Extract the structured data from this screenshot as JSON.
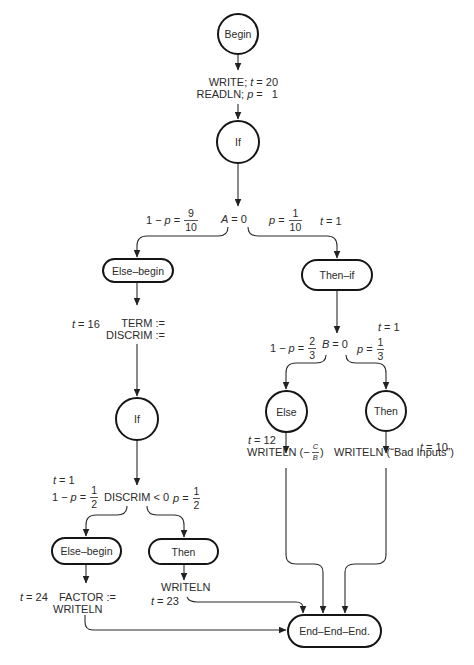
{
  "diagram": {
    "nodes": {
      "begin": "Begin",
      "if_a": "If",
      "else_begin_a": "Else–begin",
      "then_if": "Then–if",
      "if_discrim": "If",
      "else_begin_discrim": "Else–begin",
      "then_discrim": "Then",
      "else_b": "Else",
      "then_b": "Then",
      "end": "End–End–End."
    },
    "begin_block": {
      "line1": {
        "stmt": "WRITE;",
        "var": "t",
        "rest": "= 20"
      },
      "line2": {
        "stmt": "READLN;",
        "var": "p",
        "rest": "=   1"
      }
    },
    "branch_a": {
      "left_prob": {
        "prefix": "1 −",
        "var": "p",
        "eq": "=",
        "num": "9",
        "den": "10"
      },
      "condition": {
        "var": "A",
        "rest": "= 0"
      },
      "right_prob": {
        "var": "p",
        "eq": "=",
        "num": "1",
        "den": "10"
      },
      "right_time": {
        "var": "t",
        "rest": "= 1"
      }
    },
    "else_begin_a_block": {
      "time": {
        "var": "t",
        "rest": "= 16"
      },
      "line1": "TERM :=",
      "line2": "DISCRIM :="
    },
    "branch_discrim": {
      "left_time": {
        "var": "t",
        "rest": "= 1"
      },
      "left_prob": {
        "prefix": "1 −",
        "var": "p",
        "eq": "=",
        "num": "1",
        "den": "2"
      },
      "condition": "DISCRIM < 0",
      "right_prob": {
        "var": "p",
        "eq": "=",
        "num": "1",
        "den": "2"
      }
    },
    "else_begin_discrim_block": {
      "time": {
        "var": "t",
        "rest": "= 24"
      },
      "line1": "FACTOR :=",
      "line2": "WRITELN"
    },
    "then_discrim_block": {
      "line1": "WRITELN",
      "time": {
        "var": "t",
        "rest": "= 23"
      }
    },
    "branch_b": {
      "right_time": {
        "var": "t",
        "rest": "= 1"
      },
      "left_prob": {
        "prefix": "1 −",
        "var": "p",
        "eq": "=",
        "num": "2",
        "den": "3"
      },
      "condition": {
        "var": "B",
        "rest": "= 0"
      },
      "right_prob": {
        "var": "p",
        "eq": "=",
        "num": "1",
        "den": "3"
      }
    },
    "else_b_block": {
      "time": {
        "var": "t",
        "rest": "= 12"
      },
      "stmt": {
        "prefix": "WRITELN (−",
        "num": "C",
        "den": "B",
        "suffix": ")"
      }
    },
    "then_b_block": {
      "time": {
        "var": "t",
        "rest": "= 10"
      },
      "stmt": "WRITELN (“Bad Inputs”)"
    },
    "colors": {
      "line": "#2a2a2a",
      "node_border": "#151515",
      "text": "#2b2b2b",
      "background": "#ffffff"
    }
  }
}
